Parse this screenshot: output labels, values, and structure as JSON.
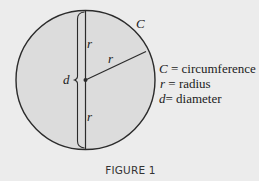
{
  "figure": {
    "caption": "FIGURE 1",
    "circle": {
      "center": [
        85.5,
        80
      ],
      "radius": 69.5,
      "fill": "#dcdcdc",
      "stroke": "#2b2b2b"
    },
    "background": "#ececec",
    "labels": {
      "circumference_symbol": "C",
      "radius_upper": "r",
      "radius_diagonal": "r",
      "radius_lower": "r",
      "diameter_symbol": "d"
    },
    "legend": [
      {
        "symbol": "C",
        "eq": " = ",
        "meaning": "circumference"
      },
      {
        "symbol": "r",
        "eq": " = ",
        "meaning": "radius"
      },
      {
        "symbol": "d",
        "eq": "= ",
        "meaning": "diameter"
      }
    ]
  }
}
